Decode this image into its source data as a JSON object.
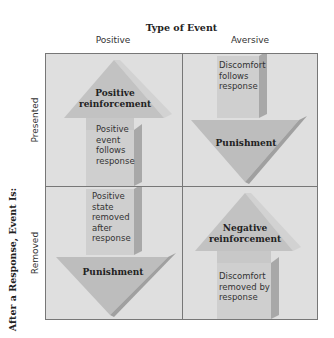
{
  "header": {
    "title": "Type of Event",
    "columns": [
      "Positive",
      "Aversive"
    ]
  },
  "side": {
    "title": "After a Response, Event Is:",
    "rows": [
      "Presented",
      "Removed"
    ]
  },
  "cells": {
    "presented_positive": {
      "label": "Positive reinforcement",
      "label_lines": [
        "Positive",
        "reinforcement"
      ],
      "description": [
        "Positive",
        "event",
        "follows",
        "response"
      ],
      "arrow": "up"
    },
    "presented_aversive": {
      "label": "Punishment",
      "description": [
        "Discomfort",
        "follows",
        "response"
      ],
      "arrow": "down"
    },
    "removed_positive": {
      "label": "Punishment",
      "description": [
        "Positive",
        "state",
        "removed",
        "after",
        "response"
      ],
      "arrow": "down"
    },
    "removed_aversive": {
      "label": "Negative reinforcement",
      "label_lines": [
        "Negative",
        "reinforcement"
      ],
      "description": [
        "Discomfort",
        "removed by",
        "response"
      ],
      "arrow": "up"
    }
  },
  "colors": {
    "cell_bg": "#dfdfdf",
    "arrow_face": "#c4c4c4",
    "arrow_light": "#d6d6d6",
    "arrow_side": "#a8a8a8",
    "grid_line": "#777777"
  }
}
